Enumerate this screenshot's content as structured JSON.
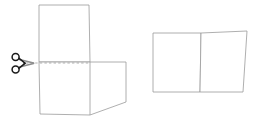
{
  "figure": {
    "background_color": "#ffffff",
    "stroke_color": "#9a9a9a",
    "dash_color": "#a8a8a8",
    "scissors_color": "#1b1b1b",
    "width": 258,
    "height": 127
  },
  "left_group": {
    "name": "original-shape-being-cut",
    "upper_piece": {
      "label": "upper-piece",
      "points": "39,5 89,5 90,62 39,62"
    },
    "lower_piece": {
      "label": "lower-piece",
      "points": "39,62 126,62 126,102 90,115 40,114"
    },
    "outline_path": "39,5 89,5 90,62 126,62 126,102 90,115 40,114",
    "cut_line": {
      "label": "cut-line",
      "x1": 26,
      "y1": 63,
      "x2": 89,
      "y2": 63,
      "style": "dashed"
    },
    "inner_vertical_edge": {
      "label": "piece-boundary",
      "x1": 90,
      "y1": 62,
      "x2": 90,
      "y2": 115
    }
  },
  "right_group": {
    "name": "rearranged-shapes",
    "left_piece": {
      "label": "rearranged-left-piece",
      "points": "153,33 201,33 200,92 153,92"
    },
    "right_piece": {
      "label": "rearranged-right-piece",
      "points": "201,33 247,31 243,92 200,92"
    }
  },
  "scissors": {
    "name": "scissors-icon",
    "center_x": 19,
    "center_y": 63,
    "hole_radius": 3.4,
    "upper_hole": {
      "cx": 16.5,
      "cy": 57.5
    },
    "lower_hole": {
      "cx": 16.5,
      "cy": 69.0
    },
    "blade_tip_x": 34
  }
}
